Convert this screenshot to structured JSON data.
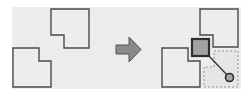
{
  "diagram": {
    "colors": {
      "background": "#ffffff",
      "panel": "#ececec",
      "outline": "#4a4a4a",
      "arrow_fill": "#8a8a8a",
      "arrow_stroke": "#555555",
      "hatch_fill": "#9a9a9a",
      "selection_border": "#2e2e2e",
      "dashed": "#8e8e8e",
      "handle": "#3a3a3a"
    },
    "before": {
      "shapes": [
        "top-shape",
        "bottom-shape"
      ]
    },
    "transition": {
      "icon": "right-arrow-icon"
    },
    "after": {
      "shapes": [
        "top-shape",
        "bottom-shape"
      ],
      "selection": "hatched-square",
      "guide": "dashed-extent",
      "handle": "circle-handle-icon"
    }
  }
}
